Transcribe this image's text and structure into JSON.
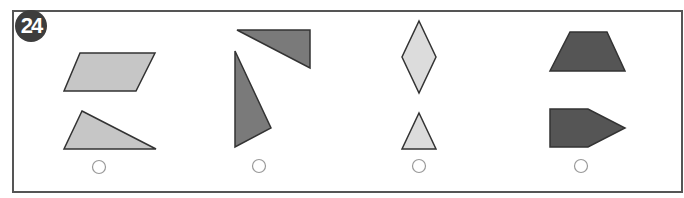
{
  "question": {
    "number": "24"
  },
  "colors": {
    "frame": "#555555",
    "stroke": "#333333",
    "light_gray": "#c8c8c8",
    "mid_gray": "#999999",
    "dark_gray": "#595959",
    "very_light_gray": "#dcdcdc",
    "circle": "#999999"
  },
  "options": [
    {
      "id": "A",
      "shapes": [
        "parallelogram",
        "triangle"
      ],
      "fill": "light-gray"
    },
    {
      "id": "B",
      "shapes": [
        "right-triangle",
        "triangle"
      ],
      "fill": "mid-gray"
    },
    {
      "id": "C",
      "shapes": [
        "rhombus",
        "isosceles-triangle"
      ],
      "fill": "very-light-gray"
    },
    {
      "id": "D",
      "shapes": [
        "trapezoid",
        "pentagon"
      ],
      "fill": "dark-gray"
    }
  ]
}
